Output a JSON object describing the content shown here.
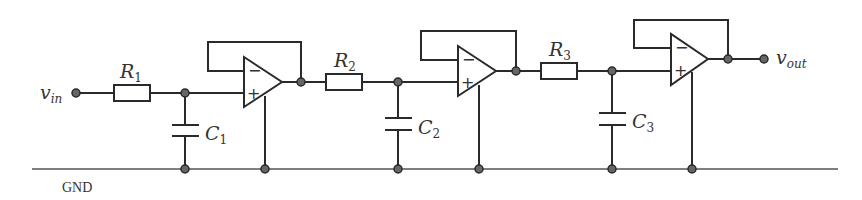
{
  "diagram": {
    "type": "circuit",
    "input_label": "v",
    "input_sub": "in",
    "output_label": "v",
    "output_sub": "out",
    "ground_label": "GND",
    "components": {
      "R1": {
        "name": "R",
        "sub": "1"
      },
      "R2": {
        "name": "R",
        "sub": "2"
      },
      "R3": {
        "name": "R",
        "sub": "3"
      },
      "C1": {
        "name": "C",
        "sub": "1"
      },
      "C2": {
        "name": "C",
        "sub": "2"
      },
      "C3": {
        "name": "C",
        "sub": "3"
      }
    },
    "opamp_signs": {
      "minus": "−",
      "plus": "+"
    },
    "colors": {
      "wire": "#2a2a2a",
      "node": "#666666",
      "background": "#ffffff"
    }
  }
}
